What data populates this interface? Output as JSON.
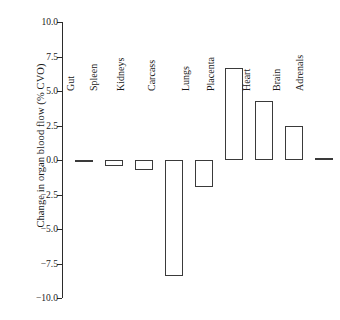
{
  "chart_data": {
    "type": "bar",
    "title": "",
    "xlabel": "",
    "ylabel": "Change in organ blood flow (% CVO)",
    "ylim": [
      -10.0,
      10.0
    ],
    "yticks": [
      "10.0",
      "7.5",
      "5.0",
      "2.5",
      "0.0",
      "-2.5",
      "-5.0",
      "-7.5",
      "-10.0"
    ],
    "ytick_values": [
      10.0,
      7.5,
      5.0,
      2.5,
      0.0,
      -2.5,
      -5.0,
      -7.5,
      -10.0
    ],
    "grid": false,
    "legend": "none",
    "orientation": "vertical",
    "baseline": 0.0,
    "categories": [
      "Gut",
      "Spleen",
      "Kidneys",
      "Carcass",
      "Lungs",
      "Placenta",
      "Heart",
      "Brain",
      "Adrenals"
    ],
    "values": [
      -0.1,
      -0.45,
      -0.7,
      -8.4,
      -1.95,
      6.7,
      4.3,
      2.5,
      0.15
    ],
    "bar_style": {
      "fill": "#ffffff",
      "edge": "#3a3a3a",
      "edge_width": 1
    },
    "axis_color": "#2b2b2b"
  },
  "axis": {
    "y_title": "Change in organ blood flow (% CVO)"
  }
}
